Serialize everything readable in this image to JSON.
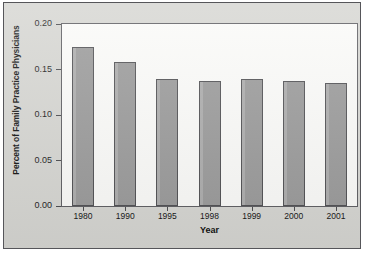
{
  "chart_data": {
    "type": "bar",
    "title": "",
    "xlabel": "Year",
    "ylabel": "Percent of Family Practice Physicians",
    "categories": [
      "1980",
      "1990",
      "1995",
      "1998",
      "1999",
      "2000",
      "2001"
    ],
    "values": [
      0.175,
      0.158,
      0.14,
      0.137,
      0.14,
      0.137,
      0.135
    ],
    "ylim": [
      0.0,
      0.2
    ],
    "ytick_labels": [
      "0.00",
      "0.05",
      "0.10",
      "0.15",
      "0.20"
    ],
    "ytick_values": [
      0.0,
      0.05,
      0.1,
      0.15,
      0.2
    ],
    "grid": false,
    "legend": false,
    "legend_position": "none",
    "series": [
      {
        "name": "Percent of Family Practice Physicians",
        "values": [
          0.175,
          0.158,
          0.14,
          0.137,
          0.14,
          0.137,
          0.135
        ]
      }
    ]
  },
  "style": {
    "bar_fill": "#9a9a9a",
    "bar_edge": "#4f4f52",
    "plot_background": "#fbfbf9",
    "panel_background": "#d6d6d2",
    "axis_color": "#5d5d61",
    "text_color": "#111111"
  }
}
